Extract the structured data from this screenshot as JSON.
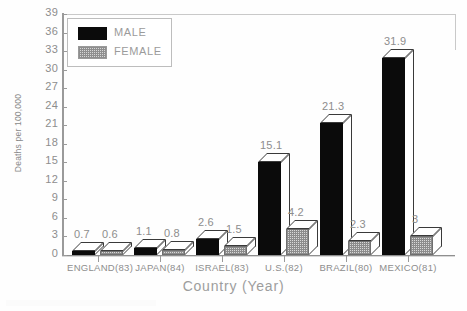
{
  "chart_data": {
    "type": "bar",
    "title": "",
    "xlabel": "Country (Year)",
    "ylabel": "Deaths per 100,000",
    "categories": [
      "ENGLAND(83)",
      "JAPAN(84)",
      "ISRAEL(83)",
      "U.S.(82)",
      "BRAZIL(80)",
      "MEXICO(81)"
    ],
    "series": [
      {
        "name": "MALE",
        "values": [
          0.7,
          1.1,
          2.6,
          15.1,
          21.3,
          31.9
        ],
        "color": "#0b0b0b"
      },
      {
        "name": "FEMALE",
        "values": [
          0.6,
          0.8,
          1.5,
          4.2,
          2.3,
          3.0
        ],
        "color": "#d9d9d9"
      }
    ],
    "data_labels": [
      "0.7",
      "0.6",
      "1.1",
      "0.8",
      "2.6",
      "1.5",
      "15.1",
      "4.2",
      "21.3",
      "2.3",
      "31.9",
      "3"
    ],
    "ylim": [
      0,
      39
    ],
    "ytick_step": 3,
    "yticks": [
      "39",
      "36",
      "33",
      "30",
      "27",
      "24",
      "21",
      "18",
      "15",
      "12",
      "9",
      "6",
      "3",
      "0"
    ],
    "grid": false,
    "legend_position": "top-left",
    "style": "3d-bars-grayscale"
  },
  "legend": {
    "items": [
      {
        "label": "MALE",
        "swatch": "male-swatch"
      },
      {
        "label": "FEMALE",
        "swatch": "female-swatch"
      }
    ]
  },
  "axes": {
    "y_title": "Deaths per 100,000",
    "x_title": "Country (Year)"
  }
}
